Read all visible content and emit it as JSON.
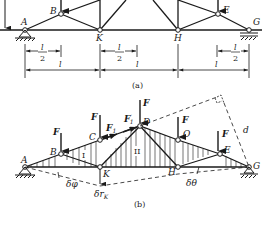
{
  "figure": {
    "panel_a": {
      "caption": "(a)",
      "nodes": {
        "A": "A",
        "B": "B",
        "K": "K",
        "H": "H",
        "E": "E",
        "G": "G"
      },
      "dimensions": {
        "half_left": {
          "num": "l",
          "den": "2"
        },
        "full_left": "l",
        "half_mid": {
          "num": "l",
          "den": "2"
        },
        "full_mid": "l",
        "half_right": {
          "num": "l",
          "den": "2"
        },
        "full_right": "l"
      }
    },
    "panel_b": {
      "caption": "(b)",
      "nodes": {
        "A": "A",
        "B": "B",
        "C": "C",
        "D": "D",
        "O": "O",
        "E": "E",
        "G": "G",
        "K": "K",
        "H": "H"
      },
      "loads": {
        "F": "F",
        "F1": "F",
        "F1_sub": "1",
        "F1p": "F",
        "F1p_sub": "1",
        "F1p_prime": "′"
      },
      "bodies": {
        "I": "I",
        "II": "II"
      },
      "virtual": {
        "dphi": "δφ",
        "drK": "δr",
        "drK_sub": "K",
        "dtheta": "δθ",
        "d": "d"
      }
    }
  }
}
